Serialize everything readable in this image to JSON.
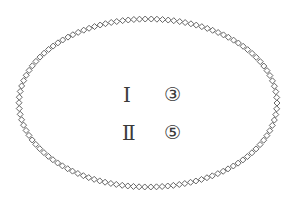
{
  "diagram": {
    "shape": "ellipse",
    "border_style": "chain-of-diamonds",
    "center": [
      148,
      103
    ],
    "radius_x": 129,
    "radius_y": 84,
    "diamond_size": 6,
    "border_color": "#555555",
    "background": "#ffffff"
  },
  "rows": [
    {
      "roman": "Ⅰ",
      "circled": "③"
    },
    {
      "roman": "Ⅱ",
      "circled": "⑤"
    }
  ],
  "text_color": "#3a3a3a"
}
